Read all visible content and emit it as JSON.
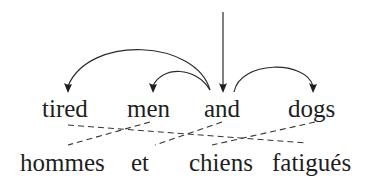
{
  "diagram": {
    "title": "",
    "source_words": [
      {
        "id": "w1",
        "text": "tired",
        "x": 42,
        "y": 96
      },
      {
        "id": "w2",
        "text": "men",
        "x": 127,
        "y": 96
      },
      {
        "id": "w3",
        "text": "and",
        "x": 204,
        "y": 96
      },
      {
        "id": "w4",
        "text": "dogs",
        "x": 288,
        "y": 96
      }
    ],
    "target_words": [
      {
        "id": "t1",
        "text": "hommes",
        "x": 20,
        "y": 150
      },
      {
        "id": "t2",
        "text": "et",
        "x": 131,
        "y": 150
      },
      {
        "id": "t3",
        "text": "chiens",
        "x": 189,
        "y": 150
      },
      {
        "id": "t4",
        "text": "fatigués",
        "x": 272,
        "y": 150
      }
    ],
    "dependency_arcs": [
      {
        "from": "and",
        "to": "tired"
      },
      {
        "from": "and",
        "to": "men"
      },
      {
        "from": "and",
        "to": "dogs"
      }
    ],
    "root_arrow": {
      "to": "and"
    },
    "alignments": [
      {
        "source": "tired",
        "target": "fatigués"
      },
      {
        "source": "men",
        "target": "hommes"
      },
      {
        "source": "and",
        "target": "et"
      },
      {
        "source": "dogs",
        "target": "chiens"
      }
    ],
    "colors": {
      "ink": "#1e1e1e",
      "background": "#ffffff"
    }
  }
}
